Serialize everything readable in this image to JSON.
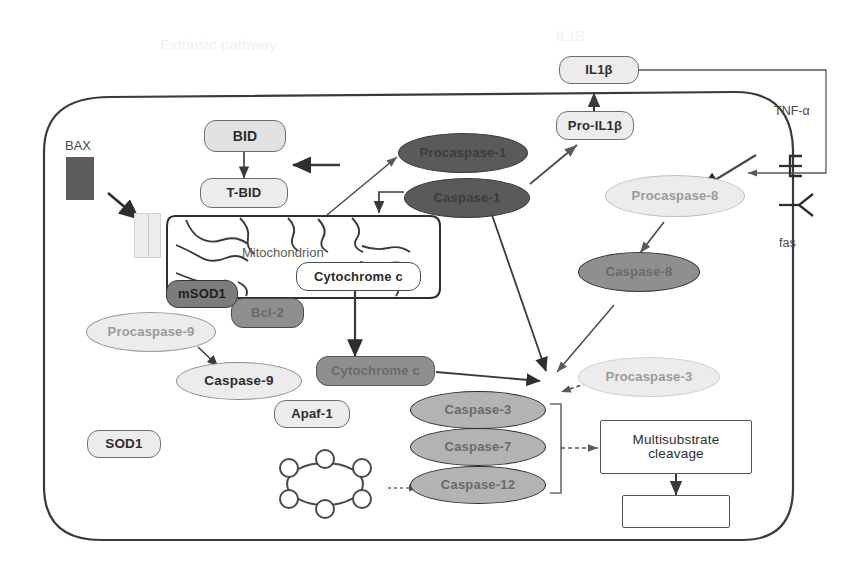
{
  "diagram": {
    "title_ghost_left": "Extrinsic pathway",
    "title_ghost_top": "IL1B",
    "cell_label": "",
    "organelle_label": "Mitochondrion",
    "receptor_tnf_label": "TNF-α",
    "receptor_fas_label": "fas"
  },
  "nodes": {
    "bax": {
      "label": "BAX"
    },
    "bid": {
      "label": "BID"
    },
    "tbid": {
      "label": "T-BID"
    },
    "mitochondrion": {
      "label": "Mitochondrion"
    },
    "cytochrome_c_in": {
      "label": "Cytochrome c"
    },
    "cytochrome_c_out": {
      "label": "Cytochrome c"
    },
    "msod1": {
      "label": "mSOD1"
    },
    "bcl2": {
      "label": "Bcl-2"
    },
    "procaspase9": {
      "label": "Procaspase-9"
    },
    "caspase9": {
      "label": "Caspase-9"
    },
    "apaf1": {
      "label": "Apaf-1"
    },
    "sod1": {
      "label": "SOD1"
    },
    "procaspase1": {
      "label": "Procaspase-1"
    },
    "caspase1": {
      "label": "Caspase-1"
    },
    "pro_il1b": {
      "label": "Pro-IL1β"
    },
    "il1b": {
      "label": "IL1β"
    },
    "procaspase8": {
      "label": "Procaspase-8"
    },
    "caspase8": {
      "label": "Caspase-8"
    },
    "procaspase3": {
      "label": "Procaspase-3"
    },
    "caspase3": {
      "label": "Caspase-3"
    },
    "caspase7": {
      "label": "Caspase-7"
    },
    "caspase12": {
      "label": "Caspase-12"
    },
    "multisubstrate": {
      "label": "Multisubstrate cleavage"
    },
    "outcome": {
      "label": ""
    },
    "apoptosome": {
      "label": ""
    },
    "tnf_alpha": {
      "label": "TNF-α"
    },
    "fas": {
      "label": "fas"
    }
  },
  "colors": {
    "stroke_dark": "#4a4a4a",
    "stroke_mid": "#6e6e6e",
    "fill_pale": "#ececec",
    "fill_light": "#e2e2e2",
    "fill_mid": "#b3b3b3",
    "fill_dark": "#8f8f8f",
    "fill_darker": "#7c7c7c",
    "fill_solid": "#5a5a5a",
    "membrane": "#3a3a3a",
    "background": "#ffffff"
  }
}
